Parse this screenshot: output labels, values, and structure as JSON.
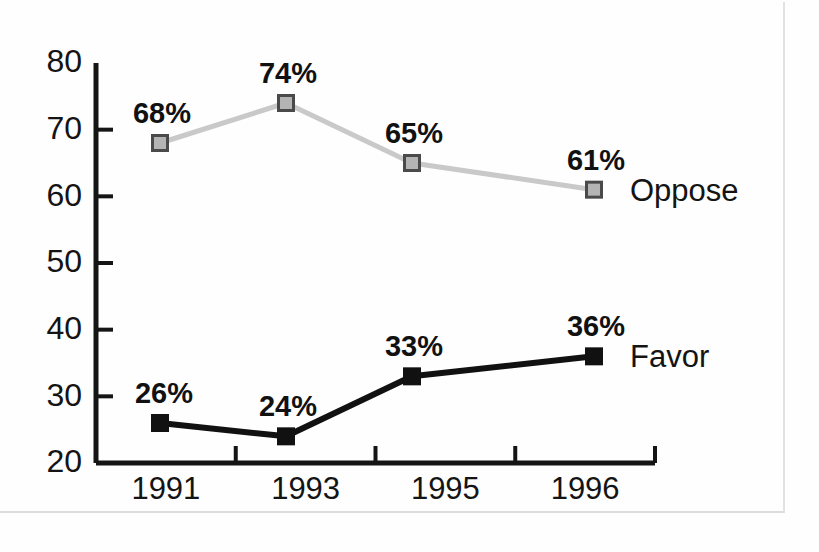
{
  "chart_data": {
    "type": "line",
    "title": "",
    "subtitle": "",
    "xlabel": "",
    "ylabel": "",
    "categories": [
      "1991",
      "1993",
      "1995",
      "1996"
    ],
    "ylim": [
      20,
      80
    ],
    "ytick_labels": [
      "20",
      "30",
      "40",
      "50",
      "60",
      "70",
      "80"
    ],
    "yticks": [
      20,
      30,
      40,
      50,
      60,
      70,
      80
    ],
    "grid": false,
    "legend_position": "inline-right-of-last-point",
    "series": [
      {
        "name": "Oppose",
        "label": "Oppose",
        "color": "#c9c9c9",
        "marker_fill": "#b4b4b4",
        "marker_stroke": "#4a4a4a",
        "values": [
          68,
          74,
          65,
          61
        ],
        "point_labels": [
          "68%",
          "74%",
          "65%",
          "61%"
        ]
      },
      {
        "name": "Favor",
        "label": "Favor",
        "color": "#111111",
        "marker_fill": "#111111",
        "marker_stroke": "#111111",
        "values": [
          26,
          24,
          33,
          36
        ],
        "point_labels": [
          "26%",
          "24%",
          "33%",
          "36%"
        ]
      }
    ]
  },
  "figure": {
    "background_color": "#ffffff",
    "axis_color": "#151515",
    "ghost_text_line1": "",
    "ghost_text_line2": ""
  }
}
